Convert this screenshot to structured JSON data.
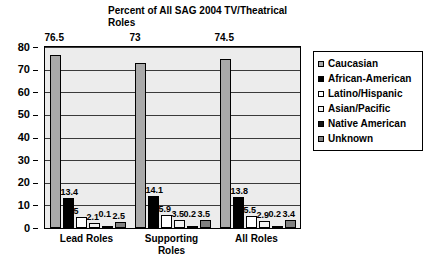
{
  "chart_data": {
    "type": "bar",
    "title": "Percent of All SAG 2004 TV/Theatrical Roles",
    "xlabel": "",
    "ylabel": "",
    "ylim": [
      0,
      80
    ],
    "yticks": [
      "0",
      "10",
      "20",
      "30",
      "40",
      "50",
      "60",
      "70",
      "80"
    ],
    "grid": true,
    "legend_position": "right",
    "categories": [
      "Lead Roles",
      "Supporting Roles",
      "All Roles"
    ],
    "category_lines": [
      [
        "Lead Roles"
      ],
      [
        "Supporting",
        "Roles"
      ],
      [
        "All Roles"
      ]
    ],
    "series": [
      {
        "name": "Caucasian",
        "color": "#a9a9a9",
        "values": [
          76.5,
          73,
          74.5
        ],
        "labels": [
          "76.5",
          "73",
          "74.5"
        ]
      },
      {
        "name": "African-American",
        "color": "#000000",
        "values": [
          13.4,
          14.1,
          13.8
        ],
        "labels": [
          "13.4",
          "14.1",
          "13.8"
        ]
      },
      {
        "name": "Latino/Hispanic",
        "color": "#ffffff",
        "values": [
          5,
          5.9,
          5.5
        ],
        "labels": [
          "5",
          "5.9",
          "5.5"
        ]
      },
      {
        "name": "Asian/Pacific",
        "color": "#f2f2f2",
        "values": [
          2.1,
          3.5,
          2.9
        ],
        "labels": [
          "2.1",
          "3.5",
          "2.9"
        ]
      },
      {
        "name": "Native American",
        "color": "#141414",
        "values": [
          0.1,
          0.2,
          0.2
        ],
        "labels": [
          "0.1",
          "0.2",
          "0.2"
        ]
      },
      {
        "name": "Unknown",
        "color": "#808080",
        "values": [
          2.5,
          3.5,
          3.4
        ],
        "labels": [
          "2.5",
          "3.5",
          "3.4"
        ]
      }
    ]
  },
  "legend": {
    "items": [
      {
        "label": "Caucasian"
      },
      {
        "label": "African-American"
      },
      {
        "label": "Latino/Hispanic"
      },
      {
        "label": "Asian/Pacific"
      },
      {
        "label": "Native American"
      },
      {
        "label": "Unknown"
      }
    ]
  }
}
